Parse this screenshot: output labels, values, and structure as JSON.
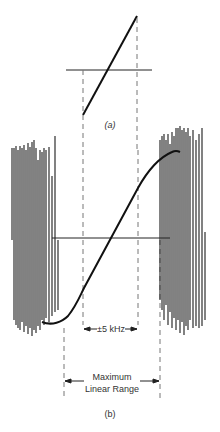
{
  "figure_a": {
    "label": "(a)",
    "line": {
      "x1": 83,
      "y1": 115,
      "x2": 137,
      "y2": 16
    },
    "axis": {
      "x1": 66,
      "x2": 152,
      "y": 70
    },
    "dashed_left_x": 83,
    "dashed_right_x": 137
  },
  "figure_b": {
    "label": "(b)",
    "inner_range_label": "±5 kHz",
    "outer_range_label_line1": "Maximum",
    "outer_range_label_line2": "Linear Range",
    "axis": {
      "x1": 52,
      "x2": 170,
      "y": 238
    },
    "inner_dashed_x": [
      83,
      138
    ],
    "outer_dashed_x": [
      64,
      160
    ]
  },
  "colors": {
    "ink": "#111111",
    "dashed": "#777777",
    "text": "#333333"
  }
}
